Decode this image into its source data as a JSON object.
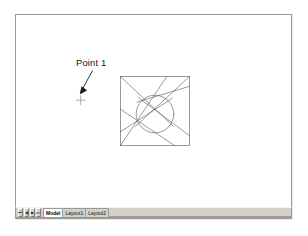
{
  "application": {
    "name": "CAD Drawing Editor",
    "window_title": "Drawing Area"
  },
  "drawing": {
    "title": "Iris Aperture Construction",
    "background_color": "#ffffff",
    "line_color": "#555555",
    "annotation_color": "#1a1a1a",
    "border_color": "#9a9a9a",
    "annotations": [
      {
        "id": "point-1",
        "label": "Point 1",
        "marker": "node-crosshair",
        "marker_x": 80,
        "marker_y": 95,
        "leader_from_x": 92,
        "leader_from_y": 70,
        "leader_to_x": 81,
        "leader_to_y": 90
      }
    ],
    "geometry": {
      "square": {
        "x": 120,
        "y": 76,
        "size": 70
      },
      "circle": {
        "cx": 155,
        "cy": 114,
        "r": 19
      },
      "blade_count": 6,
      "description": "Square boundary with inscribed tangent circle and six spiral iris blades"
    }
  },
  "tab_bar": {
    "nav_buttons": [
      {
        "name": "first",
        "glyph": "⏮"
      },
      {
        "name": "previous",
        "glyph": "◀"
      },
      {
        "name": "next",
        "glyph": "▶"
      },
      {
        "name": "last",
        "glyph": "⏭"
      }
    ],
    "tabs": [
      {
        "label": "Model",
        "active": true
      },
      {
        "label": "Layout1",
        "active": false
      },
      {
        "label": "Layout2",
        "active": false
      }
    ]
  }
}
